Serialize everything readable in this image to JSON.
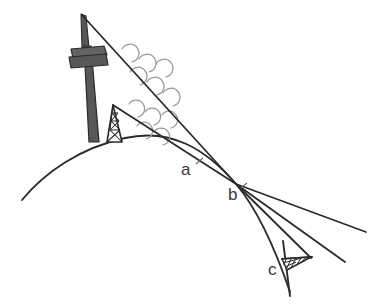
{
  "diagram": {
    "background_color": "#ffffff",
    "line_color": "#2b2b2b",
    "mast_color": "#585858",
    "mast_outline_color": "#2b2b2b",
    "wave_color": "#8a8a8a",
    "label_color": "#3a3a3a"
  },
  "labels": [
    {
      "id": "label-a",
      "text": "a",
      "x": 181,
      "y": 175
    },
    {
      "id": "label-b",
      "text": "b",
      "x": 228,
      "y": 200
    },
    {
      "id": "label-c",
      "text": "c",
      "x": 268,
      "y": 275
    }
  ],
  "elements": {
    "earth_curve": "earth-surface-curve",
    "tall_mast": "transmitter-mast",
    "mast_platform": "mast-platform",
    "lattice_tower": "lattice-tower",
    "receiver_antenna": "receiver-antenna",
    "upper_ray": "upper-ray-line",
    "lower_ray": "lower-ray-line",
    "tangent_ray": "tangent-ray-line",
    "receiver_ray": "receiver-ray-line",
    "vertical_post": "receiver-post",
    "wave_arcs": "radio-wave-arcs"
  },
  "geometry": {
    "earth_apex": {
      "x": 125,
      "y": 138
    },
    "tangent_point": {
      "x": 236,
      "y": 184
    },
    "mast_tip": {
      "x": 82,
      "y": 15
    },
    "lattice_apex": {
      "x": 113,
      "y": 105
    }
  }
}
